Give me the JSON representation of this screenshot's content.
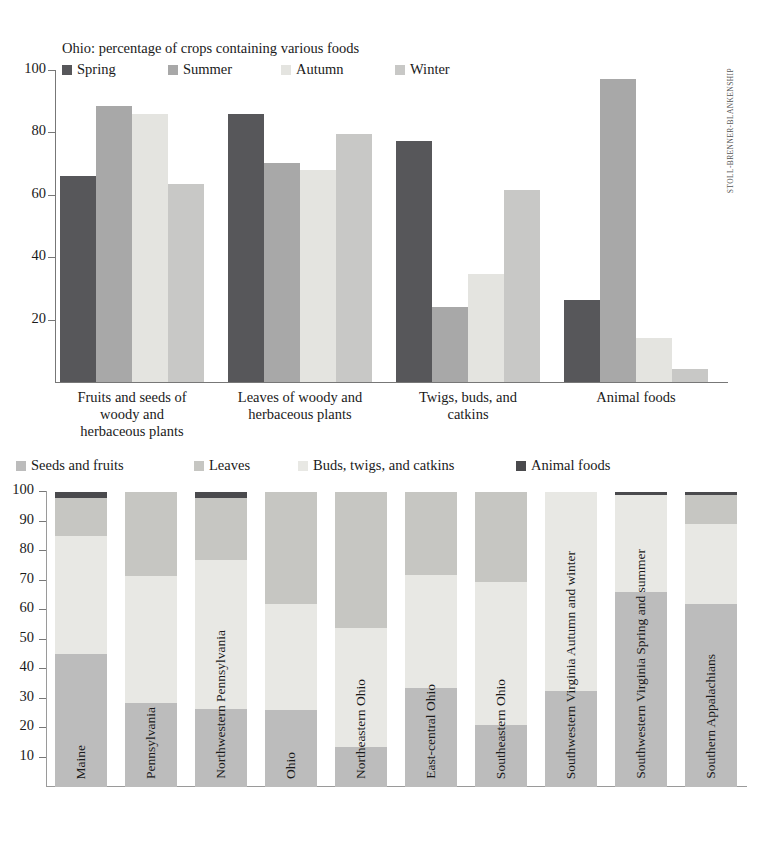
{
  "credit": "STOLL-BRENNER-BLANKENSHIP",
  "chart_data": [
    {
      "type": "bar",
      "title": "Ohio: percentage of crops containing various foods",
      "xlabel": "",
      "ylabel": "",
      "ylim": [
        0,
        100
      ],
      "yticks": [
        20,
        40,
        60,
        80,
        100
      ],
      "grid": false,
      "legend_position": "top",
      "categories": [
        "Fruits and seeds of woody and herbaceous plants",
        "Leaves of woody and herbaceous plants",
        "Twigs, buds, and catkins",
        "Animal foods"
      ],
      "category_lines": [
        [
          "Fruits and seeds of",
          "woody and",
          "herbaceous plants"
        ],
        [
          "Leaves of woody and",
          "herbaceous plants"
        ],
        [
          "Twigs, buds, and",
          "catkins"
        ],
        [
          "Animal foods"
        ]
      ],
      "series": [
        {
          "name": "Spring",
          "color": "#57575a",
          "values": [
            66.0,
            85.8,
            77.4,
            26.3
          ]
        },
        {
          "name": "Summer",
          "color": "#a8a8a8",
          "values": [
            88.4,
            70.3,
            24.2,
            97.0
          ]
        },
        {
          "name": "Autumn",
          "color": "#e4e4e0",
          "values": [
            86.0,
            68.0,
            34.7,
            14.0
          ]
        },
        {
          "name": "Winter",
          "color": "#c8c8c6",
          "values": [
            63.4,
            79.5,
            61.4,
            4.2
          ]
        }
      ]
    },
    {
      "type": "bar",
      "subtype": "stacked-100",
      "title": "",
      "xlabel": "",
      "ylabel": "",
      "ylim": [
        0,
        100
      ],
      "yticks": [
        10,
        20,
        30,
        40,
        50,
        60,
        70,
        80,
        90,
        100
      ],
      "grid": false,
      "legend_position": "top",
      "categories": [
        "Maine",
        "Pennsylvania",
        "Northwestern Pennsylvania",
        "Ohio",
        "Northeastern Ohio",
        "East-central Ohio",
        "Southeastern Ohio",
        "Southwestern Virginia  Autumn and winter",
        "Southwestern Virginia  Spring and summer",
        "Southern Appalachians"
      ],
      "series": [
        {
          "name": "Seeds and fruits",
          "color": "#bcbcbc",
          "values": [
            45.0,
            28.5,
            26.5,
            26.0,
            13.5,
            33.5,
            21.0,
            32.5,
            66.0,
            62.0
          ]
        },
        {
          "name": "Buds, twigs, and catkins",
          "color": "#e8e8e4",
          "values": [
            40.0,
            43.0,
            50.5,
            36.0,
            40.5,
            38.5,
            48.5,
            67.5,
            33.0,
            27.0
          ]
        },
        {
          "name": "Leaves",
          "color": "#c6c6c2",
          "values": [
            13.0,
            28.5,
            21.0,
            38.0,
            46.0,
            28.0,
            30.5,
            0.0,
            0.0,
            10.0
          ]
        },
        {
          "name": "Animal foods",
          "color": "#4a4a4d",
          "values": [
            2.0,
            0.0,
            2.0,
            0.0,
            0.0,
            0.0,
            0.0,
            0.0,
            1.0,
            1.0
          ]
        }
      ],
      "stack_order": [
        "Seeds and fruits",
        "Buds, twigs, and catkins",
        "Leaves",
        "Animal foods"
      ],
      "legend_order": [
        "Seeds and fruits",
        "Leaves",
        "Buds, twigs, and catkins",
        "Animal foods"
      ]
    }
  ]
}
